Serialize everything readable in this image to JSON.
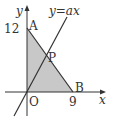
{
  "diagram": {
    "line_label": "y=ax",
    "axis_x_label": "x",
    "axis_y_label": "y",
    "origin_label": "O",
    "points": {
      "A": {
        "label": "A",
        "x": 0,
        "y": 12
      },
      "B": {
        "label": "B",
        "x": 9,
        "y": 0
      },
      "P": {
        "label": "P"
      }
    },
    "tick_labels": {
      "y": "12",
      "x": "9"
    },
    "colors": {
      "shade": "#c8c8c8",
      "line": "#333333"
    }
  }
}
